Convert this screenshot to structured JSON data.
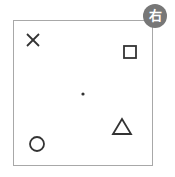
{
  "badge": {
    "label": "右",
    "color": "#777777"
  },
  "frame": {
    "border_color": "#a8a8a8"
  },
  "shapes": [
    {
      "type": "cross",
      "name": "cross-icon",
      "x": 33,
      "y": 40
    },
    {
      "type": "square",
      "name": "square-icon",
      "x": 130,
      "y": 52
    },
    {
      "type": "dot",
      "name": "center-dot",
      "x": 83,
      "y": 94
    },
    {
      "type": "triangle",
      "name": "triangle-icon",
      "x": 122,
      "y": 127
    },
    {
      "type": "circle",
      "name": "circle-icon",
      "x": 37,
      "y": 144
    }
  ],
  "stroke_color": "#333333"
}
